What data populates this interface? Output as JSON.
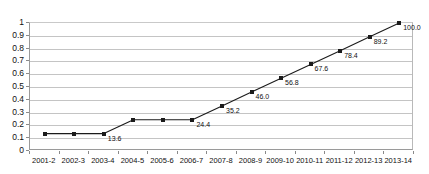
{
  "chart_data": {
    "type": "line",
    "title": "",
    "subtitle": "",
    "xlabel": "",
    "ylabel": "",
    "categories": [
      "2001-2",
      "2002-3",
      "2003-4",
      "2004-5",
      "2005-6",
      "2006-7",
      "2007-8",
      "2008-9",
      "2009-10",
      "2010-11",
      "2011-12",
      "2012-13",
      "2013-14"
    ],
    "values": [
      0.136,
      0.136,
      0.136,
      0.244,
      0.244,
      0.244,
      0.352,
      0.46,
      0.568,
      0.676,
      0.784,
      0.892,
      1.0
    ],
    "point_labels": [
      "",
      "",
      "13.6",
      "",
      "",
      "24.4",
      "35.2",
      "46.0",
      "56.8",
      "67.6",
      "78.4",
      "89.2",
      "100.0"
    ],
    "ylim": [
      0,
      1
    ],
    "ytick_labels": [
      "0",
      "0.1",
      "0.2",
      "0.3",
      "0.4",
      "0.5",
      "0.6",
      "0.7",
      "0.8",
      "0.9",
      "1"
    ],
    "ytick_values": [
      0,
      0.1,
      0.2,
      0.3,
      0.4,
      0.5,
      0.6,
      0.7,
      0.8,
      0.9,
      1
    ],
    "grid": true,
    "grid_axis": "y",
    "legend": false,
    "legend_position": "none",
    "series_color": "#1b1b1b",
    "marker_color": "#1b1b1b",
    "marker_shape": "square",
    "gridline_color": "#c4c4c4",
    "axis_color": "#8a8a8a",
    "background_color": "#ffffff",
    "label_color": "#111111"
  }
}
